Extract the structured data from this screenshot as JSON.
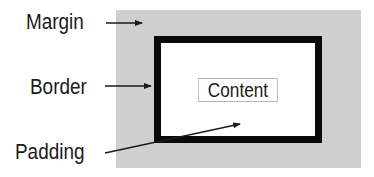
{
  "diagram": {
    "labels": {
      "margin": "Margin",
      "border": "Border",
      "padding": "Padding",
      "content": "Content"
    },
    "colors": {
      "margin_fill": "#cfcfcf",
      "border_stroke": "#0a0a0a",
      "padding_fill": "#ffffff",
      "content_outline": "#b5b5b5",
      "text": "#1a1a1a"
    },
    "arrows": [
      {
        "from": "Margin",
        "to": "margin-area"
      },
      {
        "from": "Border",
        "to": "border-box"
      },
      {
        "from": "Padding",
        "to": "padding-area"
      }
    ]
  }
}
